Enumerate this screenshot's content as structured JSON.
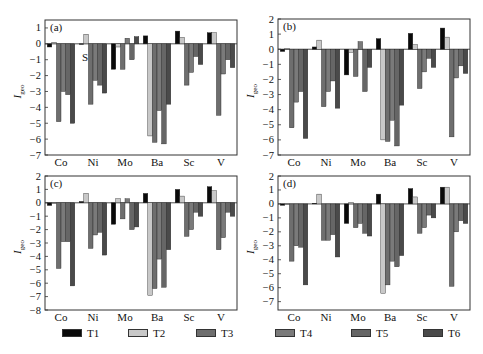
{
  "figure": {
    "y_axis_label": "I",
    "y_axis_label_subscript": "geo",
    "annotation_S": "S"
  },
  "legend": {
    "position": "bottom",
    "items": [
      {
        "label": "T1",
        "color": "#0a0a0a"
      },
      {
        "label": "T2",
        "color": "#c8c8c8"
      },
      {
        "label": "T3",
        "color": "#6e6e6e"
      },
      {
        "label": "T4",
        "color": "#7a7a7a"
      },
      {
        "label": "T5",
        "color": "#666666"
      },
      {
        "label": "T6",
        "color": "#4a4a4a"
      }
    ]
  },
  "chart_data": [
    {
      "type": "bar",
      "panel": "(a)",
      "categories": [
        "Co",
        "Ni",
        "Mo",
        "Ba",
        "Sc",
        "V"
      ],
      "ylabel": "Igeo",
      "ylim": [
        -7,
        1.5
      ],
      "yticks": [
        1,
        0,
        -1,
        -2,
        -3,
        -4,
        -5,
        -6,
        -7
      ],
      "grid": false,
      "series": [
        {
          "name": "T1",
          "values": [
            -0.2,
            0.0,
            -1.6,
            0.5,
            0.8,
            0.7
          ]
        },
        {
          "name": "T2",
          "values": [
            0.1,
            0.6,
            -0.2,
            -5.8,
            0.4,
            0.7
          ]
        },
        {
          "name": "T3",
          "values": [
            -4.9,
            -3.8,
            -1.6,
            -6.2,
            -2.6,
            -4.5
          ]
        },
        {
          "name": "T4",
          "values": [
            -3.0,
            -2.3,
            0.35,
            -4.2,
            -1.8,
            -1.9
          ]
        },
        {
          "name": "T5",
          "values": [
            -3.2,
            -2.6,
            -1.0,
            -6.3,
            -0.8,
            -1.0
          ]
        },
        {
          "name": "T6",
          "values": [
            -5.0,
            -3.1,
            0.45,
            -3.8,
            -1.3,
            -1.5
          ]
        }
      ]
    },
    {
      "type": "bar",
      "panel": "(b)",
      "categories": [
        "Co",
        "Ni",
        "Mo",
        "Ba",
        "Sc",
        "V"
      ],
      "ylabel": "Igeo",
      "ylim": [
        -7,
        2
      ],
      "yticks": [
        2,
        1,
        0,
        -1,
        -2,
        -3,
        -4,
        -5,
        -6,
        -7
      ],
      "grid": false,
      "series": [
        {
          "name": "T1",
          "values": [
            -0.15,
            0.15,
            -1.7,
            0.7,
            1.05,
            1.4
          ]
        },
        {
          "name": "T2",
          "values": [
            0.05,
            0.6,
            -0.2,
            -6.0,
            0.3,
            0.8
          ]
        },
        {
          "name": "T3",
          "values": [
            -5.2,
            -3.8,
            -1.8,
            -6.1,
            -2.6,
            -5.8
          ]
        },
        {
          "name": "T4",
          "values": [
            -3.5,
            -2.8,
            0.5,
            -4.7,
            -1.5,
            -1.9
          ]
        },
        {
          "name": "T5",
          "values": [
            -2.8,
            -2.1,
            -2.8,
            -6.4,
            -0.6,
            -1.1
          ]
        },
        {
          "name": "T6",
          "values": [
            -5.9,
            -3.9,
            -1.2,
            -3.7,
            -1.2,
            -1.6
          ]
        }
      ]
    },
    {
      "type": "bar",
      "panel": "(c)",
      "categories": [
        "Co",
        "Ni",
        "Mo",
        "Ba",
        "Sc",
        "V"
      ],
      "ylabel": "Igeo",
      "ylim": [
        -8,
        2
      ],
      "yticks": [
        2,
        1,
        0,
        -1,
        -2,
        -3,
        -4,
        -5,
        -6,
        -7,
        -8
      ],
      "grid": false,
      "series": [
        {
          "name": "T1",
          "values": [
            -0.2,
            0.1,
            -1.6,
            0.7,
            1.0,
            1.2
          ]
        },
        {
          "name": "T2",
          "values": [
            0.0,
            0.7,
            0.3,
            -6.9,
            0.5,
            0.9
          ]
        },
        {
          "name": "T3",
          "values": [
            -4.9,
            -3.4,
            -1.2,
            -6.4,
            -2.5,
            -3.5
          ]
        },
        {
          "name": "T4",
          "values": [
            -2.9,
            -2.4,
            0.3,
            -4.2,
            -2.0,
            -2.6
          ]
        },
        {
          "name": "T5",
          "values": [
            -2.9,
            -2.2,
            -2.0,
            -6.3,
            -0.7,
            -0.7
          ]
        },
        {
          "name": "T6",
          "values": [
            -6.2,
            -3.9,
            -1.8,
            -3.5,
            -1.0,
            -1.0
          ]
        }
      ]
    },
    {
      "type": "bar",
      "panel": "(d)",
      "categories": [
        "Co",
        "Ni",
        "Mo",
        "Ba",
        "Sc",
        "V"
      ],
      "ylabel": "Igeo",
      "ylim": [
        -7.6,
        2
      ],
      "yticks": [
        2,
        1,
        0,
        -1,
        -2,
        -3,
        -4,
        -5,
        -6,
        -7
      ],
      "grid": false,
      "series": [
        {
          "name": "T1",
          "values": [
            -0.1,
            0.05,
            -1.4,
            0.7,
            1.1,
            1.2
          ]
        },
        {
          "name": "T2",
          "values": [
            0.0,
            0.7,
            0.1,
            -6.4,
            0.5,
            1.2
          ]
        },
        {
          "name": "T3",
          "values": [
            -4.1,
            -2.6,
            -1.7,
            -5.8,
            -2.1,
            -5.9
          ]
        },
        {
          "name": "T4",
          "values": [
            -3.0,
            -2.6,
            -1.4,
            -4.1,
            -1.7,
            -2.0
          ]
        },
        {
          "name": "T5",
          "values": [
            -3.1,
            -2.2,
            -2.1,
            -4.5,
            -0.8,
            -1.2
          ]
        },
        {
          "name": "T6",
          "values": [
            -5.8,
            -3.8,
            -2.3,
            -3.7,
            -1.0,
            -1.4
          ]
        }
      ]
    }
  ]
}
